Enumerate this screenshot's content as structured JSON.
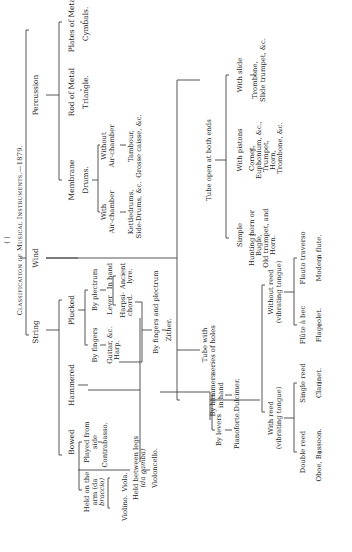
{
  "diagram": {
    "title": "Classification of Musical Instruments.—1879.",
    "page_marker": "( )",
    "orientation": "rotated 90° counter-clockwise",
    "root": {
      "string": {
        "label": "String",
        "bowed": {
          "label": "Bowed",
          "held_on_arm": {
            "label": "Held on the arm (da braccio)",
            "l1": "Held on the",
            "l2": "arm (da",
            "l3": "braccio)",
            "violino": "Violino.",
            "viola": "Viola."
          },
          "played_from_side": {
            "l1": "Played from",
            "l2": "side",
            "instrument": "Contrabasso."
          },
          "held_between_legs": {
            "l1": "Held between legs",
            "l2": "(da gamba)",
            "instrument": "Violoncello."
          }
        },
        "hammered": {
          "label": "Hammered",
          "by_levers": {
            "label": "By levers",
            "instrument": "Pianoforte."
          },
          "by_hammers": {
            "l1": "By hammers",
            "l2": "in hand",
            "instrument": "Dulcimer."
          }
        },
        "plucked": {
          "label": "Plucked",
          "by_fingers": {
            "label": "By fingers",
            "i1": "Guitar, &c.",
            "i2": "Harp."
          },
          "by_plectrum": {
            "label": "By plectrum",
            "lever": {
              "label": "Lever",
              "i1": "Harpsi-",
              "i2": "chord."
            },
            "in_hand": {
              "label": "In hand",
              "i1": "Ancient",
              "i2": "lyre."
            }
          },
          "by_fingers_and_plectrum": {
            "label": "By fingers and plectrum",
            "instrument": "Zither."
          }
        }
      },
      "wind": {
        "label": "Wind",
        "tube_series_holes": {
          "l1": "Tube with",
          "l2": "series of holes",
          "with_reed": {
            "l1": "With reed",
            "l2": "(vibrating tongue)",
            "double_reed": {
              "label": "Double reed",
              "instrument": "Oboe, Bassoon."
            },
            "single_reed": {
              "label": "Single reed",
              "instrument": "Clarinet."
            }
          },
          "without_reed": {
            "l1": "Without reed",
            "l2": "(vibrating tongue)",
            "flute_a_bec": {
              "label": "Flûte à bec",
              "instrument": "Flageolet."
            },
            "flauto_traverso": {
              "label": "Flauto traverso",
              "instrument": "Modern flute."
            }
          }
        },
        "tube_open_both_ends": {
          "label": "Tube open at both ends",
          "simple": {
            "label": "Simple",
            "i1": "Hunting horn or",
            "i2": "Bugle,",
            "i3": "Old trumpet, and",
            "i4": "Horn."
          },
          "with_pistons": {
            "label": "With pistons",
            "i1": "Cornet,",
            "i2": "Euphonium, &c.,",
            "i3": "Trumpet,",
            "i4": "Horn,",
            "i5": "Trombone, &c."
          },
          "with_slide": {
            "label": "With slide",
            "i1": "Trombone,",
            "i2": "Slide trumpet, &c."
          }
        }
      },
      "percussion": {
        "label": "Percussion",
        "membrane": {
          "label": "Membrane",
          "instrument": "Drums.",
          "with_air_chamber": {
            "l1": "With",
            "l2": "Air-chamber",
            "i1": "Kettledrums,",
            "i2": "Side-Drums, &c."
          },
          "without_air_chamber": {
            "l1": "Without",
            "l2": "Air-chamber",
            "i1": "Tambour,",
            "i2": "Grosse caisse, &c."
          }
        },
        "rod_of_metal": {
          "label": "Rod of Metal",
          "instrument": "Triangle."
        },
        "plates_of_metal": {
          "label": "Plates of Metal",
          "instrument": "Cymbals."
        }
      }
    }
  }
}
